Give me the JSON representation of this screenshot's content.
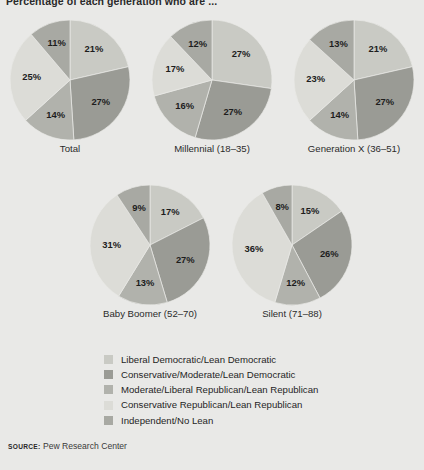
{
  "title": "Percentage of each generation who are ...",
  "source": {
    "label": "SOURCE:",
    "text": "Pew Research Center"
  },
  "legend": {
    "position": "bottom",
    "items": [
      {
        "label": "Liberal Democratic/Lean Democratic",
        "color": "#c9cac4"
      },
      {
        "label": "Conservative/Moderate/Lean Democratic",
        "color": "#9a9b95"
      },
      {
        "label": "Moderate/Liberal Republican/Lean Republican",
        "color": "#b1b2ac"
      },
      {
        "label": "Conservative Republican/Lean Republican",
        "color": "#dcdcd7"
      },
      {
        "label": "Independent/No Lean",
        "color": "#a8a9a3"
      }
    ]
  },
  "chart_data": {
    "type": "pie",
    "title": "Percentage of each generation who are ...",
    "xlabel": "",
    "ylabel": "",
    "categories": [
      "Liberal Democratic/Lean Democratic",
      "Conservative/Moderate/Lean Democratic",
      "Moderate/Liberal Republican/Lean Republican",
      "Conservative Republican/Lean Republican",
      "Independent/No Lean"
    ],
    "colors": [
      "#c9cac4",
      "#9a9b95",
      "#b1b2ac",
      "#dcdcd7",
      "#a8a9a3"
    ],
    "series": [
      {
        "name": "Total",
        "values": [
          21,
          27,
          14,
          25,
          11
        ]
      },
      {
        "name": "Millennial (18–35)",
        "values": [
          27,
          27,
          16,
          17,
          12
        ]
      },
      {
        "name": "Generation X (36–51)",
        "values": [
          21,
          27,
          14,
          23,
          13
        ]
      },
      {
        "name": "Baby Boomer (52–70)",
        "values": [
          17,
          27,
          13,
          31,
          9
        ]
      },
      {
        "name": "Silent (71–88)",
        "values": [
          15,
          26,
          12,
          36,
          8
        ]
      }
    ],
    "value_labels": [
      [
        "21%",
        "27%",
        "14%",
        "25%",
        "11%"
      ],
      [
        "27%",
        "27%",
        "16%",
        "17%",
        "12%"
      ],
      [
        "21%",
        "27%",
        "14%",
        "23%",
        "13%"
      ],
      [
        "17%",
        "27%",
        "13%",
        "31%",
        "9%"
      ],
      [
        "15%",
        "26%",
        "12%",
        "36%",
        "8%"
      ]
    ]
  },
  "pies": [
    {
      "caption": "Total",
      "left": 10,
      "top": 20,
      "size": 120,
      "cap_top": 143
    },
    {
      "caption": "Millennial (18–35)",
      "left": 152,
      "top": 20,
      "size": 120,
      "cap_top": 143
    },
    {
      "caption": "Generation X (36–51)",
      "left": 294,
      "top": 20,
      "size": 120,
      "cap_top": 143
    },
    {
      "caption": "Baby Boomer (52–70)",
      "left": 90,
      "top": 185,
      "size": 120,
      "cap_top": 308
    },
    {
      "caption": "Silent (71–88)",
      "left": 232,
      "top": 185,
      "size": 120,
      "cap_top": 308
    }
  ]
}
